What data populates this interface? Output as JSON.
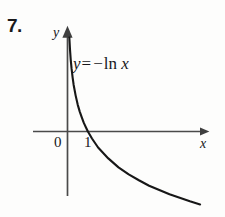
{
  "problem": {
    "number": "7."
  },
  "figure": {
    "equation": {
      "lhs": "y",
      "equals": "=",
      "minus": "−",
      "fn": "ln",
      "arg": "x",
      "full": "y = −ln x"
    },
    "axes": {
      "x_label": "x",
      "y_label": "y",
      "origin_label": "0",
      "tick_label": "1"
    },
    "colors": {
      "curve": "#171717",
      "axis": "#4a4a4a",
      "text": "#17171a",
      "background": "#fdfdfc"
    }
  },
  "chart_data": {
    "type": "line",
    "title": "",
    "subtitle": "",
    "xlabel": "x",
    "ylabel": "y",
    "annotations": [
      "y = −ln x"
    ],
    "legend": [],
    "legend_position": "none",
    "grid": false,
    "xlim": [
      0,
      7.2
    ],
    "ylim": [
      -2.4,
      3.4
    ],
    "xticks": [
      0,
      1
    ],
    "xticklabels": [
      "0",
      "1"
    ],
    "yticks": [],
    "yticklabels": [],
    "series": [
      {
        "name": "y = −ln x",
        "function": "y = -ln(x)",
        "x": [
          0.09,
          0.12,
          0.16,
          0.2,
          0.25,
          0.3,
          0.4,
          0.5,
          0.6,
          0.7,
          0.8,
          0.9,
          1.0,
          1.2,
          1.5,
          2.0,
          2.5,
          3.0,
          3.5,
          4.0,
          4.5,
          5.0,
          5.5,
          6.0,
          6.5
        ],
        "y": [
          2.41,
          2.12,
          1.83,
          1.61,
          1.39,
          1.2,
          0.92,
          0.69,
          0.51,
          0.36,
          0.22,
          0.11,
          0.0,
          -0.18,
          -0.41,
          -0.69,
          -0.92,
          -1.1,
          -1.25,
          -1.39,
          -1.5,
          -1.61,
          -1.7,
          -1.79,
          -1.87
        ]
      }
    ]
  }
}
